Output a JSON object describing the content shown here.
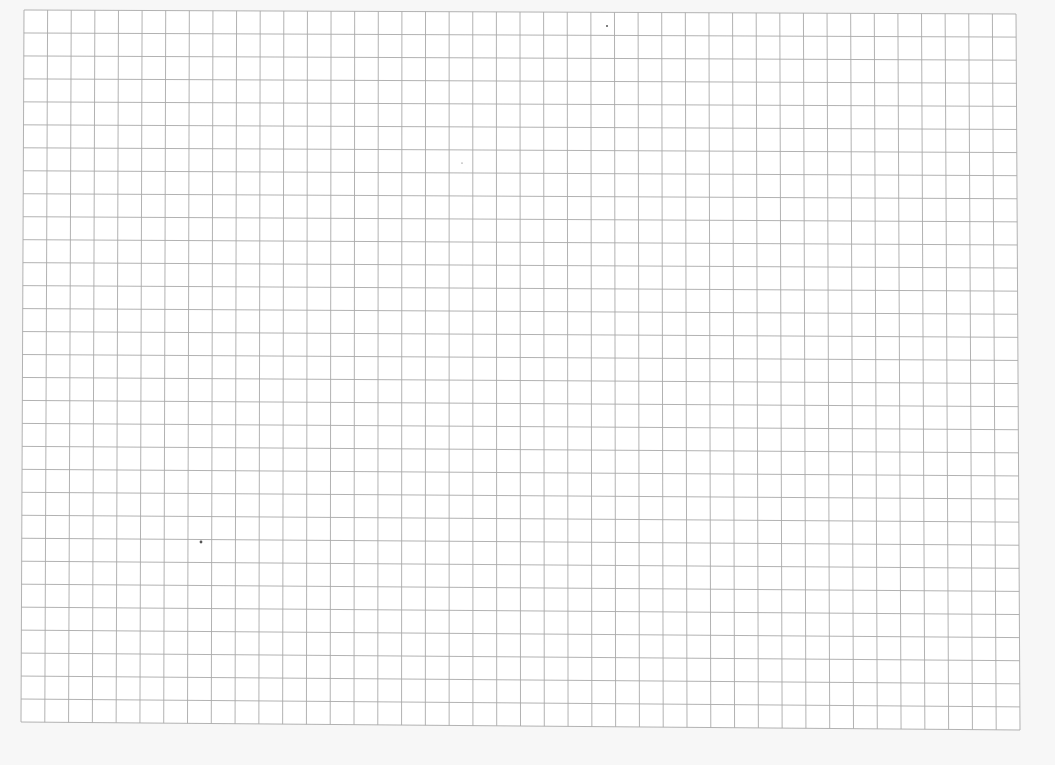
{
  "page": {
    "background_color": "#f7f7f7",
    "paper_color": "#ffffff"
  },
  "grid": {
    "columns": 42,
    "rows": 31,
    "line_color": "#a9a9a9",
    "line_width": 0.9,
    "corners": {
      "top_left": [
        24,
        10
      ],
      "top_right": [
        1016,
        14
      ],
      "bottom_left": [
        21,
        722
      ],
      "bottom_right": [
        1020,
        730
      ]
    }
  },
  "specks": [
    {
      "x": 201,
      "y": 542,
      "r": 1.4
    },
    {
      "x": 607,
      "y": 26,
      "r": 1.0
    },
    {
      "x": 462,
      "y": 163,
      "r": 0.6
    }
  ]
}
